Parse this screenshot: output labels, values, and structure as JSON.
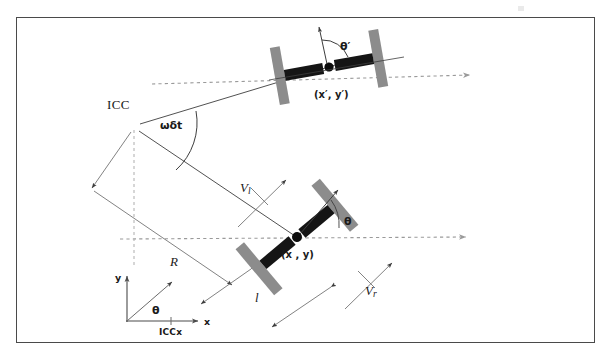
{
  "figure": {
    "border_color": "#4a4a4a",
    "background": "#ffffff"
  },
  "labels": {
    "icc": "ICC",
    "omega_delta_t": "ωδt",
    "radius": "R",
    "wheelbase": "l",
    "velocity_left": "V",
    "velocity_left_sub": "l",
    "velocity_right": "V",
    "velocity_right_sub": "r",
    "pose_current": "(x , y)",
    "pose_next": "(x′, y′)",
    "theta_current": "θ",
    "theta_next": "θ′",
    "frame_theta": "θ",
    "axis_x": "x",
    "axis_y": "y",
    "icc_x": "ICCx"
  },
  "colors": {
    "wheel_gray": "#8c8c8c",
    "axle_black": "#151515",
    "line_dark": "#3d3d3d",
    "dash_gray": "#9a9a9a",
    "hub_black": "#0d0d0d",
    "frame_border": "#4a4a4a"
  },
  "geometry": {
    "icc_point": {
      "x": 134,
      "y": 126
    },
    "robot_current_center": {
      "x": 297,
      "y": 237
    },
    "robot_next_center": {
      "x": 329,
      "y": 67
    },
    "robot_current_heading_deg": -40,
    "robot_next_heading_deg": -10,
    "radius_label_point": {
      "x": 172,
      "y": 258
    },
    "wheelbase_label_point": {
      "x": 255,
      "y": 296
    },
    "frame_origin": {
      "x": 127,
      "y": 320
    }
  },
  "icons": {
    "arrow_head": "arrow-head",
    "hub_dot": "robot-hub-dot"
  }
}
